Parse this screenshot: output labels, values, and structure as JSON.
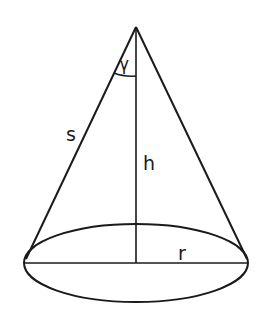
{
  "diagram": {
    "stroke_color": "#1a1a1a",
    "background": "#ffffff",
    "apex": [
      136,
      27
    ],
    "base_center": [
      136,
      263
    ],
    "base_rx": 112,
    "base_ry": 39,
    "labels": {
      "angle": "γ",
      "slant": "s",
      "height": "h",
      "radius": "r"
    },
    "label_positions": {
      "angle": [
        121,
        66
      ],
      "slant": [
        70,
        137
      ],
      "height": [
        148,
        166
      ],
      "radius": [
        182,
        258
      ]
    }
  }
}
